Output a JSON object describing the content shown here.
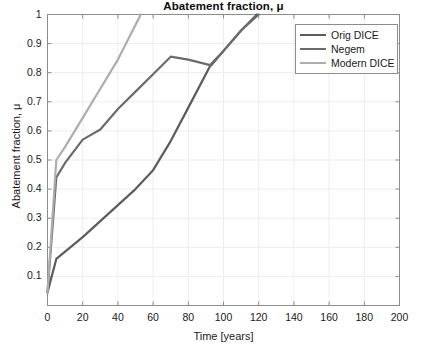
{
  "chart_data": {
    "type": "line",
    "title": "Abatement fraction, μ",
    "xlabel": "Time [years]",
    "ylabel": "Abatement fraction, μ",
    "xlim": [
      0,
      200
    ],
    "ylim": [
      0,
      1
    ],
    "xticks": [
      0,
      20,
      40,
      60,
      80,
      100,
      120,
      140,
      160,
      180,
      200
    ],
    "xtick_labels": [
      "0",
      "20",
      "40",
      "60",
      "80",
      "100",
      "120",
      "140",
      "160",
      "180",
      "200"
    ],
    "yticks": [
      0.1,
      0.2,
      0.3,
      0.4,
      0.5,
      0.6,
      0.7,
      0.8,
      0.9,
      1
    ],
    "ytick_labels": [
      "0.1",
      "0.2",
      "0.3",
      "0.4",
      "0.5",
      "0.6",
      "0.7",
      "0.8",
      "0.9",
      "1"
    ],
    "grid": true,
    "legend_position": "upper right",
    "legend_entries": [
      "Orig DICE",
      "Negem",
      "Modern DICE"
    ],
    "series": [
      {
        "name": "Orig DICE",
        "color": "#5c5c5c",
        "x": [
          0,
          5,
          10,
          20,
          30,
          40,
          50,
          60,
          70,
          80,
          93,
          100,
          110,
          119
        ],
        "y": [
          0.045,
          0.16,
          0.185,
          0.235,
          0.29,
          0.345,
          0.4,
          0.465,
          0.565,
          0.68,
          0.83,
          0.875,
          0.945,
          1.0
        ]
      },
      {
        "name": "Negem",
        "color": "#6b6b6b",
        "x": [
          0,
          5,
          10,
          20,
          30,
          40,
          50,
          60,
          70,
          80,
          93,
          100,
          110,
          120
        ],
        "y": [
          0.045,
          0.44,
          0.49,
          0.57,
          0.605,
          0.675,
          0.735,
          0.795,
          0.855,
          0.845,
          0.825,
          0.875,
          0.945,
          1.0
        ]
      },
      {
        "name": "Modern DICE",
        "color": "#adadad",
        "x": [
          0,
          5,
          10,
          20,
          30,
          40,
          53
        ],
        "y": [
          0.045,
          0.5,
          0.545,
          0.645,
          0.745,
          0.845,
          1.0
        ]
      }
    ]
  },
  "legend": {
    "items": [
      {
        "label": "Orig DICE",
        "color": "#5c5c5c"
      },
      {
        "label": "Negem",
        "color": "#6b6b6b"
      },
      {
        "label": "Modern DICE",
        "color": "#adadad"
      }
    ]
  },
  "axes": {
    "title": "Abatement fraction, μ",
    "xlabel": "Time [years]",
    "ylabel": "Abatement fraction, μ"
  },
  "colors": {
    "axis": "#8c8c8c",
    "grid": "#eceded",
    "background": "#ffffff",
    "text": "#1a1a1a"
  }
}
